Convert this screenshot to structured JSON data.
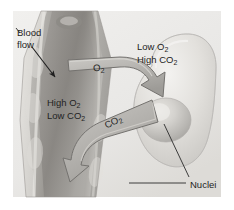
{
  "figure": {
    "type": "biology-diagram",
    "background_color": "#ffffff",
    "illustration_bounds": {
      "x": 13,
      "y": 11,
      "width": 208,
      "height": 186
    },
    "palette": {
      "vessel_fill": "#a9a7a4",
      "vessel_fill_light": "#d8d6d2",
      "vessel_fill_dark": "#7e7c79",
      "vessel_outline": "#8e8c88",
      "cell_fill": "#dedcd8",
      "cell_fill_light": "#efeeec",
      "cell_outline": "#bdbbb7",
      "nucleus_fill": "#c9c7c3",
      "nucleus_highlight": "#e4e2de",
      "arrow_fill": "#b0aeaa",
      "arrow_fill_light": "#c8c6c2",
      "arrow_outline": "#6f6d6a",
      "plate_fill": "#cdcbc7",
      "leader_line": "#2a2a2a",
      "text": "#232323"
    }
  },
  "labels": {
    "blood_flow": {
      "line1": "Blood",
      "line2": "flow"
    },
    "vessel_gas": {
      "line1_pre": "High O",
      "line1_sub": "2",
      "line2_pre": "Low CO",
      "line2_sub": "2"
    },
    "cell_gas": {
      "line1_pre": "Low O",
      "line1_sub": "2",
      "line2_pre": "High CO",
      "line2_sub": "2"
    },
    "oxygen_arrow": {
      "text_pre": "O",
      "text_sub": "2"
    },
    "carbon_dioxide_arrow": {
      "text_pre": "CO",
      "text_sub": "2"
    },
    "nuclei": "Nuclei"
  },
  "annotations": {
    "blood_flow_arrow": {
      "name": "blood-flow-direction-arrow",
      "from": [
        32,
        47
      ],
      "to": [
        56,
        78
      ],
      "color": "#1f1f1f"
    },
    "oxygen_transfer_arrow": {
      "name": "oxygen-diffusion-arrow",
      "direction": "vessel-to-cell",
      "label": "O2"
    },
    "carbon_dioxide_transfer_arrow": {
      "name": "carbon-dioxide-diffusion-arrow",
      "direction": "cell-to-vessel",
      "label": "CO2"
    },
    "nuclei_leader_lines": [
      {
        "from": [
          186,
          183
        ],
        "to": [
          129,
          183
        ]
      },
      {
        "from": [
          189,
          177
        ],
        "to": [
          163,
          124
        ]
      }
    ]
  }
}
